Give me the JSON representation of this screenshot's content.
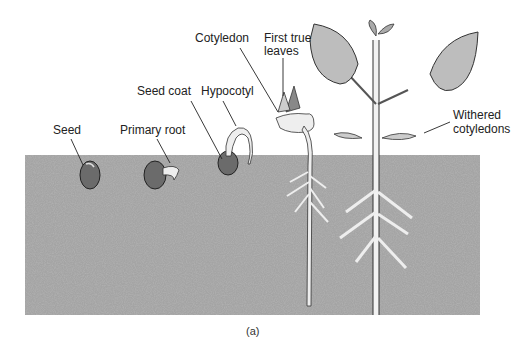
{
  "figure": {
    "caption": "(a)",
    "colors": {
      "soil": "#9a9a9a",
      "plant_fill": "#ececec",
      "stroke": "#333333",
      "background": "#ffffff"
    },
    "stages": [
      {
        "id": "seed",
        "label": "Seed"
      },
      {
        "id": "primary-root",
        "label": "Primary root"
      },
      {
        "id": "seed-coat",
        "label": "Seed coat"
      },
      {
        "id": "hypocotyl",
        "label": "Hypocotyl"
      },
      {
        "id": "cotyledon",
        "label": "Cotyledon"
      },
      {
        "id": "first-true-leaves",
        "label_line1": "First true",
        "label_line2": "leaves"
      },
      {
        "id": "withered-cotyledons",
        "label_line1": "Withered",
        "label_line2": "cotyledons"
      }
    ]
  }
}
